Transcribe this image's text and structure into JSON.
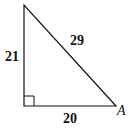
{
  "diagram": {
    "type": "right-triangle",
    "sides": {
      "vertical_leg": "21",
      "hypotenuse": "29",
      "horizontal_leg": "20"
    },
    "vertex_label": "A",
    "right_angle_marker": true,
    "stroke_color": "#111111"
  }
}
